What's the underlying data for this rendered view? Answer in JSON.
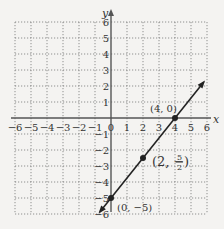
{
  "header": {
    "partial_text": "y = ... p(...)"
  },
  "chart_data": {
    "type": "line",
    "title": "",
    "xlabel": "x",
    "ylabel": "y",
    "xlim": [
      -6,
      6
    ],
    "ylim": [
      -6,
      6
    ],
    "grid": true,
    "x_ticks": [
      -6,
      -5,
      -4,
      -3,
      -2,
      -1,
      0,
      1,
      2,
      3,
      4,
      5,
      6
    ],
    "y_ticks": [
      -6,
      -5,
      -4,
      -3,
      -2,
      -1,
      1,
      2,
      3,
      4,
      5,
      6
    ],
    "series": [
      {
        "name": "line",
        "slope": 1.25,
        "intercept": -5,
        "x": [
          -0.7,
          5.8
        ],
        "y": [
          -5.875,
          2.25
        ]
      }
    ],
    "points": [
      {
        "x": 4,
        "y": 0,
        "label": "(4, 0)"
      },
      {
        "x": 2,
        "y": -2.5,
        "label": "(2, −5/2)"
      },
      {
        "x": 0,
        "y": -5,
        "label": "(0, −5)"
      }
    ],
    "colors": {
      "line": "#222222",
      "grid": "#777777",
      "axis": "#555555",
      "background": "#f4f3f1"
    }
  },
  "labels": {
    "x_axis": "x",
    "y_axis": "y",
    "p1": "(4, 0)",
    "p2_open": "(2, −",
    "p2_num": "5",
    "p2_den": "2",
    "p2_close": ")",
    "p3": "(0, −5)"
  }
}
